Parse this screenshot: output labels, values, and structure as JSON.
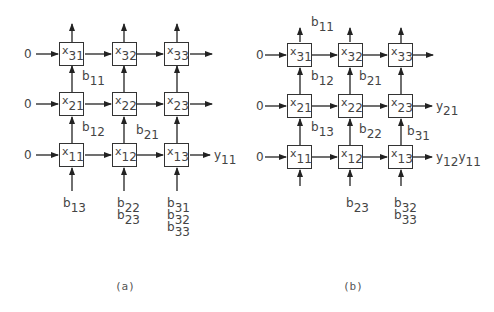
{
  "panels": [
    {
      "caption": "(a)",
      "cells": [
        {
          "id": "x31",
          "base": "x",
          "sub": "31"
        },
        {
          "id": "x32",
          "base": "x",
          "sub": "32"
        },
        {
          "id": "x33",
          "base": "x",
          "sub": "33"
        },
        {
          "id": "x21",
          "base": "x",
          "sub": "21"
        },
        {
          "id": "x22",
          "base": "x",
          "sub": "22"
        },
        {
          "id": "x23",
          "base": "x",
          "sub": "23"
        },
        {
          "id": "x11",
          "base": "x",
          "sub": "11"
        },
        {
          "id": "x12",
          "base": "x",
          "sub": "12"
        },
        {
          "id": "x13",
          "base": "x",
          "sub": "13"
        }
      ],
      "row_inputs": [
        "0",
        "0",
        "0"
      ],
      "labels": {
        "b11": {
          "base": "b",
          "sub": "11"
        },
        "b12": {
          "base": "b",
          "sub": "12"
        },
        "b21": {
          "base": "b",
          "sub": "21"
        },
        "b13": {
          "base": "b",
          "sub": "13"
        },
        "b22": {
          "base": "b",
          "sub": "22"
        },
        "b23": {
          "base": "b",
          "sub": "23"
        },
        "b31": {
          "base": "b",
          "sub": "31"
        },
        "b32": {
          "base": "b",
          "sub": "32"
        },
        "b33": {
          "base": "b",
          "sub": "33"
        },
        "y11": {
          "base": "y",
          "sub": "11"
        }
      }
    },
    {
      "caption": "(b)",
      "cells": [
        {
          "id": "x31",
          "base": "x",
          "sub": "31"
        },
        {
          "id": "x32",
          "base": "x",
          "sub": "32"
        },
        {
          "id": "x33",
          "base": "x",
          "sub": "33"
        },
        {
          "id": "x21",
          "base": "x",
          "sub": "21"
        },
        {
          "id": "x22",
          "base": "x",
          "sub": "22"
        },
        {
          "id": "x23",
          "base": "x",
          "sub": "23"
        },
        {
          "id": "x11",
          "base": "x",
          "sub": "11"
        },
        {
          "id": "x12",
          "base": "x",
          "sub": "12"
        },
        {
          "id": "x13",
          "base": "x",
          "sub": "13"
        }
      ],
      "row_inputs": [
        "0",
        "0",
        "0"
      ],
      "labels": {
        "b11": {
          "base": "b",
          "sub": "11"
        },
        "b12": {
          "base": "b",
          "sub": "12"
        },
        "b21": {
          "base": "b",
          "sub": "21"
        },
        "b13": {
          "base": "b",
          "sub": "13"
        },
        "b22": {
          "base": "b",
          "sub": "22"
        },
        "b31": {
          "base": "b",
          "sub": "31"
        },
        "b23": {
          "base": "b",
          "sub": "23"
        },
        "b32": {
          "base": "b",
          "sub": "32"
        },
        "b33": {
          "base": "b",
          "sub": "33"
        },
        "y21": {
          "base": "y",
          "sub": "21"
        },
        "y12": {
          "base": "y",
          "sub": "12"
        },
        "y11": {
          "base": "y",
          "sub": "11"
        }
      }
    }
  ]
}
